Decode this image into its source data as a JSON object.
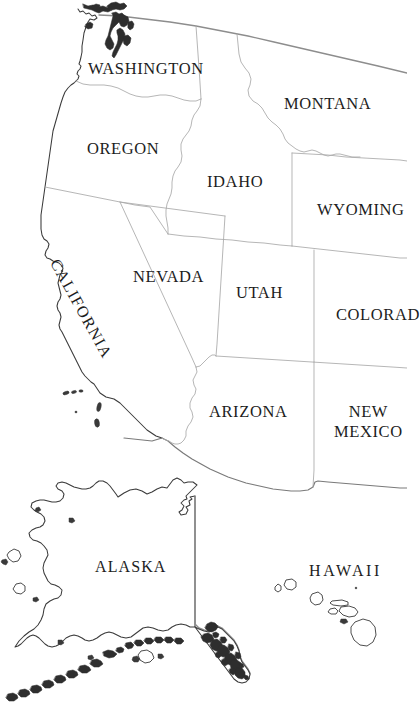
{
  "map": {
    "title": "Western United States map with Alaska and Hawaii",
    "background_color": "#ffffff",
    "coastline_color": "#3a3a3a",
    "internal_border_color": "#a9a9a9",
    "national_border_color": "#8d8d8d",
    "label_color": "#1d1d1d",
    "labels": {
      "washington": "WASHINGTON",
      "montana": "MONTANA",
      "oregon": "OREGON",
      "idaho": "IDAHO",
      "wyoming": "WYOMING",
      "nevada": "NEVADA",
      "utah": "UTAH",
      "colorado": "COLORAD",
      "california": "CALIFORNIA",
      "arizona": "ARIZONA",
      "new_mexico_line1": "NEW",
      "new_mexico_line2": "MEXICO",
      "alaska": "ALASKA",
      "hawaii": "HAWAII"
    }
  }
}
